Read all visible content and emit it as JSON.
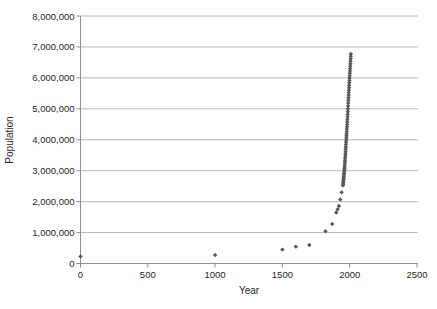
{
  "chart_data": {
    "type": "scatter",
    "title": "",
    "xlabel": "Year",
    "ylabel": "Population",
    "xlim": [
      0,
      2500
    ],
    "ylim": [
      0,
      8000000
    ],
    "grid": "horizontal",
    "legend_position": "none",
    "x_ticks": [
      0,
      500,
      1000,
      1500,
      2000,
      2500
    ],
    "x_tick_labels": [
      "0",
      "500",
      "1000",
      "1500",
      "2000",
      "2500"
    ],
    "y_ticks": [
      0,
      1000000,
      2000000,
      3000000,
      4000000,
      5000000,
      6000000,
      7000000,
      8000000
    ],
    "y_tick_labels": [
      "0",
      "1,000,000",
      "2,000,000",
      "3,000,000",
      "4,000,000",
      "5,000,000",
      "6,000,000",
      "7,000,000",
      "8,000,000"
    ],
    "marker": {
      "shape": "diamond",
      "size": 4.4,
      "color": "#575757"
    },
    "colors": {
      "background": "#ffffff",
      "gridline": "#b8b8b8",
      "axis": "#8f8f8f",
      "text": "#1f1f1f",
      "marker": "#575757"
    },
    "series": [
      {
        "name": "World population (thousands)",
        "points": [
          [
            0,
            230000
          ],
          [
            1000,
            275000
          ],
          [
            1500,
            450000
          ],
          [
            1600,
            545000
          ],
          [
            1700,
            600000
          ],
          [
            1820,
            1042000
          ],
          [
            1870,
            1276000
          ],
          [
            1900,
            1650000
          ],
          [
            1910,
            1750000
          ],
          [
            1920,
            1860000
          ],
          [
            1930,
            2070000
          ],
          [
            1940,
            2300000
          ],
          [
            1950,
            2525000
          ],
          [
            1951,
            2572000
          ],
          [
            1952,
            2619000
          ],
          [
            1953,
            2666000
          ],
          [
            1954,
            2714000
          ],
          [
            1955,
            2766000
          ],
          [
            1956,
            2816000
          ],
          [
            1957,
            2869000
          ],
          [
            1958,
            2920000
          ],
          [
            1959,
            2968000
          ],
          [
            1960,
            3019000
          ],
          [
            1961,
            3070000
          ],
          [
            1962,
            3126000
          ],
          [
            1963,
            3195000
          ],
          [
            1964,
            3263000
          ],
          [
            1965,
            3331000
          ],
          [
            1966,
            3400000
          ],
          [
            1967,
            3469000
          ],
          [
            1968,
            3540000
          ],
          [
            1969,
            3614000
          ],
          [
            1970,
            3690000
          ],
          [
            1971,
            3767000
          ],
          [
            1972,
            3843000
          ],
          [
            1973,
            3917000
          ],
          [
            1974,
            3990000
          ],
          [
            1975,
            4061000
          ],
          [
            1976,
            4131000
          ],
          [
            1977,
            4201000
          ],
          [
            1978,
            4271000
          ],
          [
            1979,
            4344000
          ],
          [
            1980,
            4418000
          ],
          [
            1981,
            4495000
          ],
          [
            1982,
            4575000
          ],
          [
            1983,
            4657000
          ],
          [
            1984,
            4740000
          ],
          [
            1985,
            4826000
          ],
          [
            1986,
            4914000
          ],
          [
            1987,
            5004000
          ],
          [
            1988,
            5094000
          ],
          [
            1989,
            5184000
          ],
          [
            1990,
            5273000
          ],
          [
            1991,
            5358000
          ],
          [
            1992,
            5441000
          ],
          [
            1993,
            5522000
          ],
          [
            1994,
            5601000
          ],
          [
            1995,
            5682000
          ],
          [
            1996,
            5761000
          ],
          [
            1997,
            5839000
          ],
          [
            1998,
            5917000
          ],
          [
            1999,
            5995000
          ],
          [
            2000,
            6072000
          ],
          [
            2001,
            6149000
          ],
          [
            2002,
            6225000
          ],
          [
            2003,
            6302000
          ],
          [
            2004,
            6379000
          ],
          [
            2005,
            6457000
          ],
          [
            2006,
            6536000
          ],
          [
            2007,
            6615000
          ],
          [
            2008,
            6695000
          ],
          [
            2009,
            6775000
          ]
        ]
      }
    ]
  }
}
